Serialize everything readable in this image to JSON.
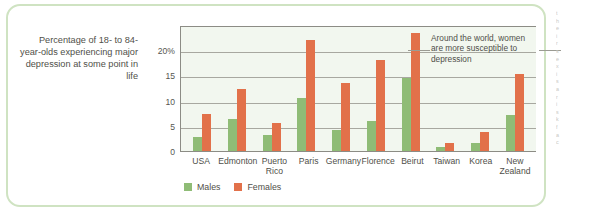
{
  "caption": {
    "text": "Percentage of 18- to 84-year-olds experiencing major depression at some point in life"
  },
  "annotation": {
    "text": "Around the world, women are more susceptible to depression"
  },
  "legend": {
    "males_label": "Males",
    "females_label": "Females"
  },
  "colors": {
    "male": "#8fbc76",
    "female": "#e2714a",
    "frame": "#cfe3c2",
    "plot_background": "#f2f7ef",
    "gridline": "#a8a8a0",
    "axis": "#8c8c85"
  },
  "yticks": [
    "20%",
    "15",
    "10",
    "5",
    "0"
  ],
  "margin_text": [
    "t",
    "h",
    "e",
    "i",
    "r",
    "",
    "s",
    "e",
    "x",
    "",
    "i",
    "s",
    "",
    "a",
    "",
    "r",
    "i",
    "s",
    "k",
    "",
    "f",
    "a",
    "c"
  ],
  "chart_data": {
    "type": "bar",
    "title": "",
    "xlabel": "",
    "ylabel": "Percentage of 18- to 84-year-olds experiencing major depression at some point in life",
    "ylim": [
      0,
      25
    ],
    "yticks": [
      0,
      5,
      10,
      15,
      20
    ],
    "ytick_labels": [
      "0",
      "5",
      "10",
      "15",
      "20%"
    ],
    "grid": true,
    "legend_position": "bottom-left",
    "categories": [
      "USA",
      "Edmonton",
      "Puerto Rico",
      "Paris",
      "Germany",
      "Florence",
      "Beirut",
      "Taiwan",
      "Korea",
      "New Zealand"
    ],
    "series": [
      {
        "name": "Males",
        "color": "#8fbc76",
        "values": [
          2.8,
          6.4,
          3.2,
          10.5,
          4.2,
          6.0,
          14.5,
          0.8,
          1.5,
          7.2
        ]
      },
      {
        "name": "Females",
        "color": "#e2714a",
        "values": [
          7.3,
          12.4,
          5.5,
          22.0,
          13.5,
          18.0,
          23.5,
          1.5,
          3.8,
          15.3
        ]
      }
    ],
    "annotations": [
      "Around the world, women are more susceptible to depression"
    ]
  }
}
